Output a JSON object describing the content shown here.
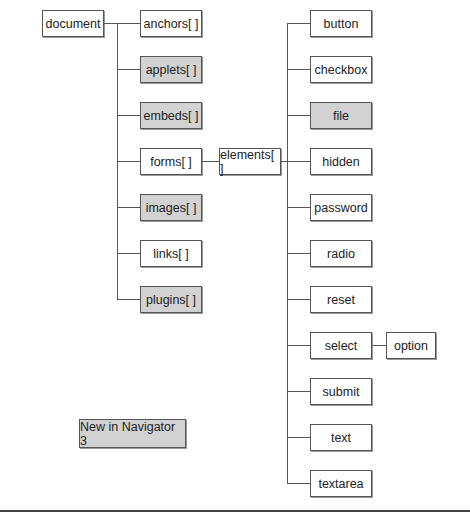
{
  "diagram": {
    "root": {
      "label": "document"
    },
    "document_children": [
      {
        "label": "anchors[ ]",
        "new": false
      },
      {
        "label": "applets[ ]",
        "new": true
      },
      {
        "label": "embeds[ ]",
        "new": true
      },
      {
        "label": "forms[ ]",
        "new": false
      },
      {
        "label": "images[ ]",
        "new": true
      },
      {
        "label": "links[ ]",
        "new": false
      },
      {
        "label": "plugins[ ]",
        "new": true
      }
    ],
    "elements": {
      "label": "elements[ ]"
    },
    "element_types": [
      {
        "label": "button",
        "new": false
      },
      {
        "label": "checkbox",
        "new": false
      },
      {
        "label": "file",
        "new": true
      },
      {
        "label": "hidden",
        "new": false
      },
      {
        "label": "password",
        "new": false
      },
      {
        "label": "radio",
        "new": false
      },
      {
        "label": "reset",
        "new": false
      },
      {
        "label": "select",
        "new": false
      },
      {
        "label": "submit",
        "new": false
      },
      {
        "label": "text",
        "new": false
      },
      {
        "label": "textarea",
        "new": false
      }
    ],
    "option": {
      "label": "option"
    },
    "legend": {
      "label": "New in Navigator 3"
    },
    "colors": {
      "new_fill": "#d2d2d2",
      "normal_fill": "#ffffff",
      "line": "#555555"
    }
  }
}
